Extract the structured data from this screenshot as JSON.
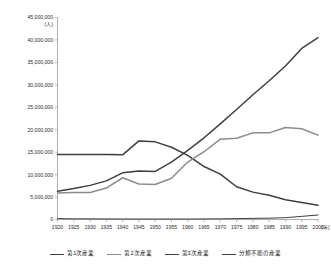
{
  "chart_data": {
    "type": "line",
    "title": "",
    "xlabel": "(年)",
    "ylabel": "(人)",
    "x": [
      1920,
      1925,
      1930,
      1935,
      1940,
      1945,
      1950,
      1955,
      1960,
      1965,
      1970,
      1975,
      1980,
      1985,
      1990,
      1995,
      2000
    ],
    "xlim": [
      1920,
      2000
    ],
    "ylim": [
      0,
      45000000
    ],
    "ytick_values": [
      0,
      5000000,
      10000000,
      15000000,
      20000000,
      25000000,
      30000000,
      35000000,
      40000000,
      45000000
    ],
    "ytick_labels": [
      "0",
      "5,000,000",
      "10,000,000",
      "15,000,000",
      "20,000,000",
      "25,000,000",
      "30,000,000",
      "35,000,000",
      "40,000,000",
      "45,000,000"
    ],
    "xtick_labels": [
      "1920",
      "1925",
      "1930",
      "1935",
      "1940",
      "1945",
      "1950",
      "1955",
      "1960",
      "1965",
      "1970",
      "1975",
      "1980",
      "1985",
      "1990",
      "1995",
      "2000"
    ],
    "grid": false,
    "legend_position": "bottom",
    "series": [
      {
        "name": "第1次産業",
        "color": "#3f3f3f",
        "width": 1.5,
        "values": [
          14500000,
          14500000,
          14500000,
          14500000,
          14400000,
          17500000,
          17300000,
          16100000,
          14300000,
          11800000,
          10100000,
          7300000,
          6100000,
          5400000,
          4400000,
          3800000,
          3200000
        ]
      },
      {
        "name": "第2次産業",
        "color": "#8c8c8c",
        "width": 1.5,
        "values": [
          5900000,
          6000000,
          6000000,
          7000000,
          9300000,
          7900000,
          7800000,
          9200000,
          12800000,
          15100000,
          17900000,
          18100000,
          19300000,
          19300000,
          20500000,
          20200000,
          18800000
        ]
      },
      {
        "name": "第3次産業",
        "color": "#3f3f3f",
        "width": 1.5,
        "values": [
          6300000,
          6900000,
          7600000,
          8600000,
          10400000,
          10800000,
          10700000,
          12800000,
          15400000,
          18200000,
          21300000,
          24500000,
          27800000,
          30900000,
          34200000,
          38100000,
          40500000
        ]
      },
      {
        "name": "分類不能の産業",
        "color": "#3f3f3f",
        "width": 1.0,
        "values": [
          200000,
          150000,
          150000,
          120000,
          120000,
          100000,
          100000,
          100000,
          100000,
          120000,
          150000,
          200000,
          250000,
          300000,
          400000,
          700000,
          1000000
        ]
      }
    ]
  },
  "legend": {
    "items": [
      {
        "label": "第1次産業"
      },
      {
        "label": "第2次産業"
      },
      {
        "label": "第3次産業"
      },
      {
        "label": "分類不能の産業"
      }
    ]
  }
}
